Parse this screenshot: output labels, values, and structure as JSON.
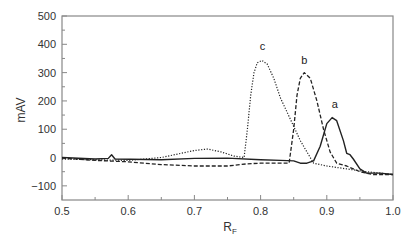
{
  "chart_data": {
    "type": "line",
    "title": "",
    "xlabel": "R",
    "xlabel_subscript": "F",
    "ylabel": "mAV",
    "xlim": [
      0.5,
      1.0
    ],
    "ylim": [
      -150,
      500
    ],
    "x_ticks": [
      "0.5",
      "0.6",
      "0.7",
      "0.8",
      "0.9",
      "1.0"
    ],
    "y_ticks": [
      "500",
      "400",
      "300",
      "200",
      "100",
      "0",
      "−100"
    ],
    "grid": false,
    "legend": "none (curves labeled directly)",
    "series": [
      {
        "name": "a",
        "style": "solid",
        "points": [
          [
            0.5,
            0
          ],
          [
            0.55,
            -5
          ],
          [
            0.57,
            -3
          ],
          [
            0.575,
            10
          ],
          [
            0.58,
            -5
          ],
          [
            0.65,
            -8
          ],
          [
            0.7,
            -3
          ],
          [
            0.75,
            -2
          ],
          [
            0.8,
            -8
          ],
          [
            0.83,
            -10
          ],
          [
            0.85,
            -12
          ],
          [
            0.86,
            -20
          ],
          [
            0.87,
            -20
          ],
          [
            0.88,
            -12
          ],
          [
            0.89,
            40
          ],
          [
            0.9,
            120
          ],
          [
            0.908,
            141
          ],
          [
            0.915,
            130
          ],
          [
            0.925,
            60
          ],
          [
            0.93,
            15
          ],
          [
            0.935,
            10
          ],
          [
            0.94,
            -5
          ],
          [
            0.95,
            -40
          ],
          [
            0.96,
            -55
          ],
          [
            0.98,
            -55
          ],
          [
            1.0,
            -60
          ]
        ],
        "peak": {
          "x": 0.908,
          "y": 141
        }
      },
      {
        "name": "b",
        "style": "dashed",
        "points": [
          [
            0.5,
            -2
          ],
          [
            0.55,
            -10
          ],
          [
            0.6,
            -15
          ],
          [
            0.65,
            -25
          ],
          [
            0.7,
            -30
          ],
          [
            0.75,
            -30
          ],
          [
            0.78,
            -22
          ],
          [
            0.8,
            -20
          ],
          [
            0.83,
            -20
          ],
          [
            0.843,
            -20
          ],
          [
            0.85,
            100
          ],
          [
            0.855,
            220
          ],
          [
            0.86,
            280
          ],
          [
            0.866,
            300
          ],
          [
            0.875,
            280
          ],
          [
            0.885,
            200
          ],
          [
            0.895,
            100
          ],
          [
            0.905,
            20
          ],
          [
            0.915,
            -20
          ],
          [
            0.93,
            -30
          ],
          [
            0.95,
            -50
          ],
          [
            0.97,
            -60
          ],
          [
            1.0,
            -60
          ]
        ],
        "peak": {
          "x": 0.866,
          "y": 300
        }
      },
      {
        "name": "c",
        "style": "dotted",
        "points": [
          [
            0.5,
            -5
          ],
          [
            0.55,
            -8
          ],
          [
            0.6,
            -10
          ],
          [
            0.65,
            0
          ],
          [
            0.68,
            15
          ],
          [
            0.7,
            25
          ],
          [
            0.72,
            30
          ],
          [
            0.74,
            20
          ],
          [
            0.76,
            5
          ],
          [
            0.775,
            0
          ],
          [
            0.78,
            100
          ],
          [
            0.785,
            220
          ],
          [
            0.79,
            300
          ],
          [
            0.795,
            335
          ],
          [
            0.802,
            343
          ],
          [
            0.81,
            330
          ],
          [
            0.82,
            280
          ],
          [
            0.83,
            210
          ],
          [
            0.84,
            160
          ],
          [
            0.85,
            110
          ],
          [
            0.86,
            60
          ],
          [
            0.87,
            20
          ],
          [
            0.88,
            -20
          ],
          [
            0.9,
            -30
          ],
          [
            0.93,
            -40
          ],
          [
            0.96,
            -50
          ],
          [
            1.0,
            -60
          ]
        ],
        "peak": {
          "x": 0.802,
          "y": 343
        }
      }
    ],
    "annotations": [
      {
        "text": "a",
        "x": 0.912,
        "y": 175
      },
      {
        "text": "b",
        "x": 0.866,
        "y": 330
      },
      {
        "text": "c",
        "x": 0.803,
        "y": 380
      }
    ]
  },
  "labels": {
    "ylabel": "mAV",
    "xlabel_main": "R",
    "xlabel_sub": "F",
    "peak_a": "a",
    "peak_b": "b",
    "peak_c": "c"
  }
}
